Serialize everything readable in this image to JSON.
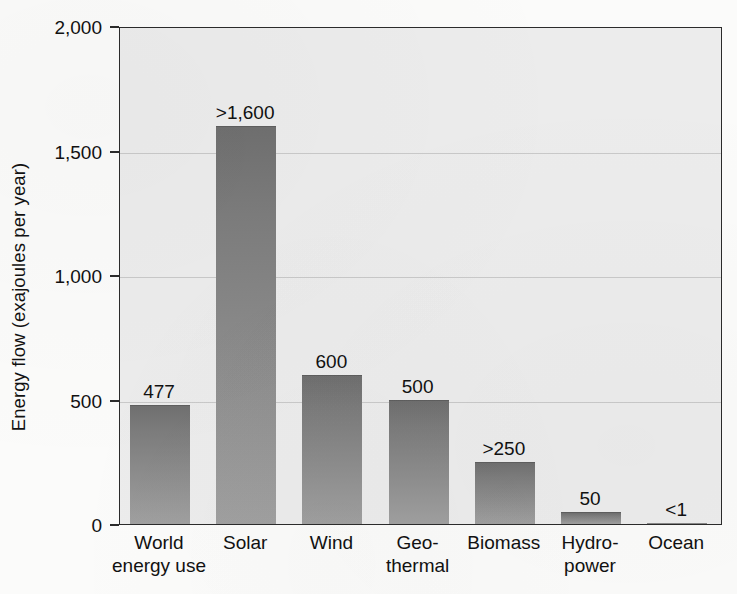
{
  "chart_data": {
    "type": "bar",
    "title": "",
    "xlabel": "",
    "ylabel": "Energy flow (exajoules per year)",
    "ylim": [
      0,
      2000
    ],
    "ytick_labels": [
      "0",
      "500",
      "1,000",
      "1,500",
      "2,000"
    ],
    "ytick_values": [
      0,
      500,
      1000,
      1500,
      2000
    ],
    "grid": true,
    "legend": "none",
    "categories": [
      "World energy use",
      "Solar",
      "Wind",
      "Geo-thermal",
      "Biomass",
      "Hydro-power",
      "Ocean"
    ],
    "category_lines": [
      [
        "World",
        "energy use"
      ],
      [
        "Solar",
        ""
      ],
      [
        "Wind",
        ""
      ],
      [
        "Geo-",
        "thermal"
      ],
      [
        "Biomass",
        ""
      ],
      [
        "Hydro-",
        "power"
      ],
      [
        "Ocean",
        ""
      ]
    ],
    "values": [
      477,
      1600,
      600,
      500,
      250,
      50,
      1
    ],
    "value_labels": [
      "477",
      ">1,600",
      "600",
      "500",
      ">250",
      "50",
      "<1"
    ],
    "colors": {
      "bar_top": "#6f6f6f",
      "bar_bottom": "#a0a0a0",
      "plot_background": "#ececec",
      "page_background": "#fbfbfa",
      "gridline": "#c9c9c9",
      "axis": "#2b2b2b",
      "text": "#111111"
    }
  }
}
